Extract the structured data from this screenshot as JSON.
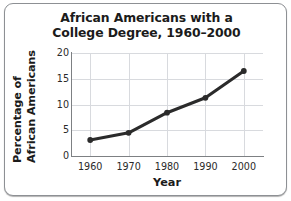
{
  "figure": {
    "title_line_1": "African Americans with a",
    "title_line_2": "College Degree, 1960–2000",
    "ylabel_line_1": "Percentage of",
    "ylabel_line_2": "African Americans",
    "xlabel": "Year",
    "frame_color": "#8d9094",
    "grid_color": "#d8dade",
    "axis_color": "#7d8083",
    "series_color": "#2b2b2b",
    "background": "#ffffff"
  },
  "chart_data": {
    "type": "line",
    "title": "African Americans with a College Degree, 1960–2000",
    "xlabel": "Year",
    "ylabel": "Percentage of African Americans",
    "x": [
      1960,
      1970,
      1980,
      1990,
      2000
    ],
    "values": [
      3.1,
      4.5,
      8.4,
      11.3,
      16.5
    ],
    "xticks": [
      "1960",
      "1970",
      "1980",
      "1990",
      "2000"
    ],
    "yticks": [
      "0",
      "5",
      "10",
      "15",
      "20"
    ],
    "xlim": [
      1955,
      2005
    ],
    "ylim": [
      0,
      20
    ],
    "grid": true,
    "legend": false,
    "marker": "circle",
    "line_color": "#2b2b2b"
  }
}
